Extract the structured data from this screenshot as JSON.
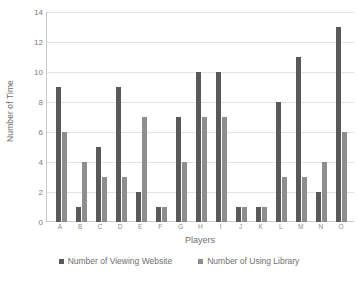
{
  "chart_data": {
    "type": "bar",
    "title": "",
    "xlabel": "Players",
    "ylabel": "Number of Time",
    "categories": [
      "A",
      "B",
      "C",
      "D",
      "E",
      "F",
      "G",
      "H",
      "I",
      "J",
      "K",
      "L",
      "M",
      "N",
      "O"
    ],
    "series": [
      {
        "name": "Number of Viewing Website",
        "color": "#595959",
        "values": [
          9,
          1,
          5,
          9,
          2,
          1,
          7,
          10,
          10,
          1,
          1,
          8,
          11,
          2,
          13
        ]
      },
      {
        "name": "Number of Using Library",
        "color": "#8e8e8e",
        "values": [
          6,
          4,
          3,
          3,
          7,
          1,
          4,
          7,
          7,
          1,
          1,
          3,
          3,
          4,
          6
        ]
      }
    ],
    "ylim": [
      0,
      14
    ],
    "yticks": [
      0,
      2,
      4,
      6,
      8,
      10,
      12,
      14
    ],
    "ytick_labels": [
      "0",
      "2",
      "4",
      "6",
      "8",
      "10",
      "12",
      "14"
    ],
    "grid": true,
    "legend_position": "bottom"
  }
}
